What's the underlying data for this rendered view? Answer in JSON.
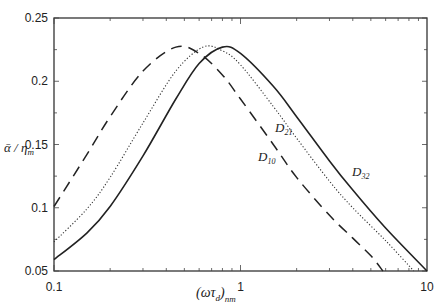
{
  "chart_data": {
    "type": "line",
    "title": "",
    "xlabel": "(ωτ_d)_nm",
    "ylabel": "ᾱ/η_m",
    "xscale": "log",
    "xlim": [
      0.1,
      10
    ],
    "ylim": [
      0.05,
      0.25
    ],
    "grid": false,
    "legend": "inline annotations",
    "x_ticks": [
      "0.1",
      "1",
      "10"
    ],
    "y_ticks": [
      "0.05",
      "0.1",
      "0.15",
      "0.2",
      "0.25"
    ],
    "series": [
      {
        "name": "D10",
        "style": "dashed",
        "x": [
          0.1,
          0.15,
          0.2,
          0.3,
          0.45,
          0.6,
          0.8,
          1.0,
          1.5,
          2.0,
          3.0,
          4.0,
          5.0,
          5.8
        ],
        "values": [
          0.101,
          0.142,
          0.172,
          0.208,
          0.227,
          0.222,
          0.205,
          0.186,
          0.15,
          0.124,
          0.094,
          0.076,
          0.062,
          0.05
        ]
      },
      {
        "name": "D21",
        "style": "dotted",
        "x": [
          0.1,
          0.15,
          0.2,
          0.3,
          0.45,
          0.63,
          0.8,
          1.0,
          1.5,
          2.0,
          3.0,
          4.0,
          6.0,
          8.5
        ],
        "values": [
          0.073,
          0.099,
          0.124,
          0.167,
          0.208,
          0.227,
          0.224,
          0.213,
          0.18,
          0.155,
          0.121,
          0.1,
          0.074,
          0.05
        ]
      },
      {
        "name": "D32",
        "style": "solid",
        "x": [
          0.1,
          0.15,
          0.2,
          0.3,
          0.45,
          0.6,
          0.8,
          1.0,
          1.5,
          2.0,
          3.0,
          4.0,
          6.0,
          10.0
        ],
        "values": [
          0.059,
          0.08,
          0.101,
          0.141,
          0.186,
          0.214,
          0.227,
          0.222,
          0.196,
          0.172,
          0.137,
          0.114,
          0.084,
          0.05
        ]
      }
    ],
    "annotations": [
      {
        "text": "D21",
        "near_x": 1.6,
        "near_y": 0.16
      },
      {
        "text": "D10",
        "near_x": 1.5,
        "near_y": 0.128
      },
      {
        "text": "D32",
        "near_x": 3.8,
        "near_y": 0.104
      }
    ]
  },
  "labels": {
    "y_axis_main": "ᾱ / η",
    "y_axis_sub": "m",
    "x_axis_main": "(ωτ",
    "x_axis_d": "d",
    "x_axis_close": ")",
    "x_axis_sub": "nm",
    "d10_main": "D",
    "d10_sub": "10",
    "d21_main": "D",
    "d21_sub": "21",
    "d32_main": "D",
    "d32_sub": "32"
  }
}
